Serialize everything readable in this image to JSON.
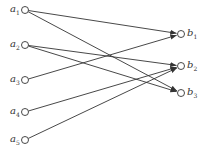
{
  "diagram": {
    "type": "bipartite-directed-graph",
    "left_nodes": [
      {
        "id": "a1",
        "base": "a",
        "sub": "1",
        "x": 25,
        "y": 10
      },
      {
        "id": "a2",
        "base": "a",
        "sub": "2",
        "x": 25,
        "y": 45
      },
      {
        "id": "a3",
        "base": "a",
        "sub": "3",
        "x": 25,
        "y": 80
      },
      {
        "id": "a4",
        "base": "a",
        "sub": "4",
        "x": 25,
        "y": 112
      },
      {
        "id": "a5",
        "base": "a",
        "sub": "5",
        "x": 25,
        "y": 140
      }
    ],
    "right_nodes": [
      {
        "id": "b1",
        "base": "b",
        "sub": "1",
        "x": 181,
        "y": 34
      },
      {
        "id": "b2",
        "base": "b",
        "sub": "2",
        "x": 181,
        "y": 66
      },
      {
        "id": "b3",
        "base": "b",
        "sub": "3",
        "x": 181,
        "y": 93
      }
    ],
    "edges": [
      {
        "from": "a1",
        "to": "b1"
      },
      {
        "from": "a1",
        "to": "b3"
      },
      {
        "from": "a2",
        "to": "b2"
      },
      {
        "from": "a2",
        "to": "b3"
      },
      {
        "from": "a3",
        "to": "b1"
      },
      {
        "from": "a4",
        "to": "b2"
      },
      {
        "from": "a5",
        "to": "b2"
      }
    ],
    "colors": {
      "line": "#333333",
      "node_fill": "#ffffff"
    }
  }
}
